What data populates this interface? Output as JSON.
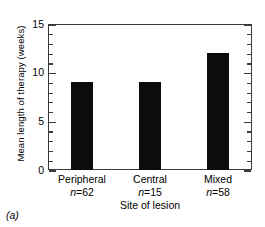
{
  "figure": {
    "panel_label": "(a)"
  },
  "chart_data": {
    "type": "bar",
    "title": "",
    "xlabel": "Site of lesion",
    "ylabel": "Mean length of therapy (weeks)",
    "categories": [
      "Peripheral",
      "Central",
      "Mixed"
    ],
    "group_sizes": [
      "n=62",
      "n=15",
      "n=58"
    ],
    "group_size_values": [
      62,
      15,
      58
    ],
    "values": [
      9,
      9,
      12
    ],
    "ylim": [
      0,
      15
    ],
    "ytick_labels": [
      "0",
      "5",
      "10",
      "15"
    ],
    "ytick_values": [
      0,
      5,
      10,
      15
    ],
    "yminor_interval": 1,
    "grid": false,
    "legend": "none",
    "bar_color": "#0c0c0c",
    "axis_color": "#3a3a3a"
  }
}
